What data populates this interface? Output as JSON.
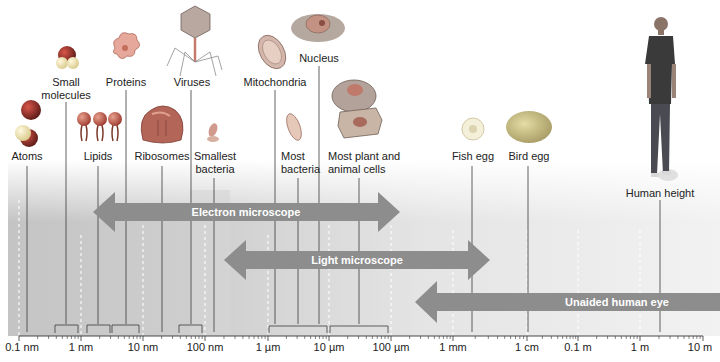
{
  "axis": {
    "ticks": [
      {
        "label": "0.1 nm",
        "x": 23
      },
      {
        "label": "1 nm",
        "x": 81
      },
      {
        "label": "10 nm",
        "x": 143
      },
      {
        "label": "100 nm",
        "x": 205
      },
      {
        "label": "1 µm",
        "x": 268
      },
      {
        "label": "10 µm",
        "x": 329
      },
      {
        "label": "100 µm",
        "x": 391
      },
      {
        "label": "1 mm",
        "x": 453
      },
      {
        "label": "1 cm",
        "x": 527
      },
      {
        "label": "0.1 m",
        "x": 578
      },
      {
        "label": "1 m",
        "x": 640
      },
      {
        "label": "10 m",
        "x": 703
      }
    ]
  },
  "ranges": {
    "electron": {
      "label": "Electron microscope",
      "x1": 93,
      "x2": 400,
      "y": 212
    },
    "light": {
      "label": "Light microscope",
      "x1": 224,
      "x2": 490,
      "y": 260
    },
    "eye": {
      "label": "Unaided human eye",
      "x1": 415,
      "x2": 720,
      "y": 302
    }
  },
  "objects": [
    {
      "name": "atoms",
      "label": "Atoms",
      "icon": "atom-icon",
      "lx": 27,
      "ly": 150,
      "line_x": 27
    },
    {
      "name": "small-molecules",
      "label_line1": "Small",
      "label_line2": "molecules",
      "icon": "molecule-icon",
      "lx": 66,
      "ly": 76,
      "line_x": 66
    },
    {
      "name": "lipids",
      "label": "Lipids",
      "icon": "lipid-icon",
      "lx": 98,
      "ly": 150,
      "line_x": 98
    },
    {
      "name": "proteins",
      "label": "Proteins",
      "icon": "protein-icon",
      "lx": 126,
      "ly": 76,
      "line_x": 126
    },
    {
      "name": "ribosomes",
      "label": "Ribosomes",
      "icon": "ribosome-icon",
      "lx": 162,
      "ly": 150,
      "line_x": 162
    },
    {
      "name": "viruses",
      "label": "Viruses",
      "icon": "virus-icon",
      "lx": 191,
      "ly": 76,
      "line_x": 191
    },
    {
      "name": "smallest-bacteria",
      "label_line1": "Smallest",
      "label_line2": "bacteria",
      "icon": "small-bacterium-icon",
      "lx": 214,
      "ly": 150,
      "line_x": 214
    },
    {
      "name": "mitochondria",
      "label": "Mitochondria",
      "icon": "mitochondrion-icon",
      "lx": 275,
      "ly": 76,
      "line_x": 275
    },
    {
      "name": "nucleus",
      "label": "Nucleus",
      "icon": "nucleus-icon",
      "lx": 319,
      "ly": 52,
      "line_x": 319
    },
    {
      "name": "most-bacteria",
      "label_line1": "Most",
      "label_line2": "bacteria",
      "icon": "bacterium-icon",
      "lx": 298,
      "ly": 150,
      "line_x": 298
    },
    {
      "name": "cells",
      "label_line1": "Most plant and",
      "label_line2": "animal cells",
      "icon": "cell-icon",
      "lx": 362,
      "ly": 150,
      "line_x": 359
    },
    {
      "name": "fish-egg",
      "label": "Fish egg",
      "icon": "fish-egg-icon",
      "lx": 472,
      "ly": 150,
      "line_x": 472
    },
    {
      "name": "bird-egg",
      "label": "Bird egg",
      "icon": "bird-egg-icon",
      "lx": 528,
      "ly": 150,
      "line_x": 528
    },
    {
      "name": "human",
      "label": "Human height",
      "icon": "human-icon",
      "lx": 660,
      "ly": 187,
      "line_x": 660
    }
  ],
  "colors": {
    "arrow": "#8c8c8c",
    "arrow_text": "#ffffff",
    "band_dark": "#c8c8c8",
    "band_light": "#efefef",
    "axis": "#333333"
  }
}
